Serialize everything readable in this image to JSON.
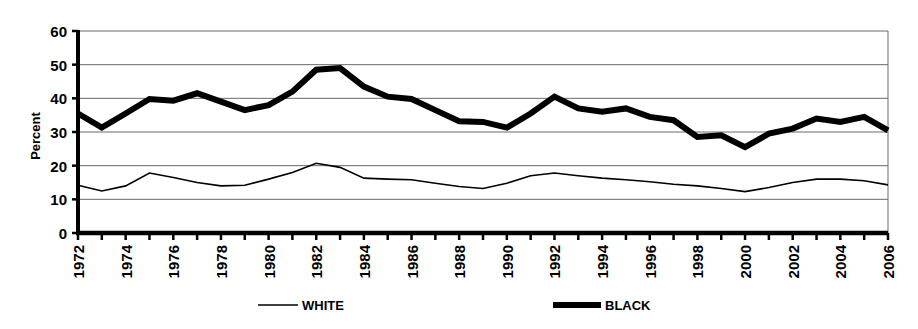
{
  "chart_data": {
    "type": "line",
    "title": "",
    "subtitle": "",
    "xlabel": "",
    "ylabel": "Percent",
    "ylim": [
      0,
      60
    ],
    "yticks": [
      0,
      10,
      20,
      30,
      40,
      50,
      60
    ],
    "ytick_labels": [
      "0",
      "10",
      "20",
      "30",
      "40",
      "50",
      "60"
    ],
    "grid": true,
    "grid_axis": "y",
    "legend_position": "bottom",
    "x": [
      1972,
      1973,
      1974,
      1975,
      1976,
      1977,
      1978,
      1979,
      1980,
      1981,
      1982,
      1983,
      1984,
      1985,
      1986,
      1987,
      1988,
      1989,
      1990,
      1991,
      1992,
      1993,
      1994,
      1995,
      1996,
      1997,
      1998,
      1999,
      2000,
      2001,
      2002,
      2003,
      2004,
      2005,
      2006
    ],
    "xtick_labels": [
      "1972",
      "",
      "1974",
      "",
      "1976",
      "",
      "1978",
      "",
      "1980",
      "",
      "1982",
      "",
      "1984",
      "",
      "1986",
      "",
      "1988",
      "",
      "1990",
      "",
      "1992",
      "",
      "1994",
      "",
      "1996",
      "",
      "1998",
      "",
      "2000",
      "",
      "2002",
      "",
      "2004",
      "",
      "2006"
    ],
    "xtick_labels_visible": [
      "1972",
      "1974",
      "1976",
      "1978",
      "1980",
      "1982",
      "1984",
      "1986",
      "1988",
      "1990",
      "1992",
      "1994",
      "1996",
      "1998",
      "2000",
      "2002",
      "2004",
      "2006"
    ],
    "xlim": [
      1972,
      2006
    ],
    "series": [
      {
        "name": "WHITE",
        "color": "#000000",
        "line_width": 1.6,
        "values": [
          14.2,
          12.5,
          14.0,
          17.8,
          16.5,
          15.0,
          14.0,
          14.2,
          16.0,
          18.0,
          20.7,
          19.5,
          16.3,
          16.0,
          15.8,
          14.8,
          13.8,
          13.2,
          14.8,
          17.0,
          17.8,
          17.0,
          16.3,
          15.8,
          15.2,
          14.5,
          14.0,
          13.2,
          12.3,
          13.5,
          15.0,
          16.0,
          16.0,
          15.5,
          14.3
        ]
      },
      {
        "name": "BLACK",
        "color": "#000000",
        "line_width": 6.0,
        "values": [
          35.5,
          31.3,
          35.5,
          39.8,
          39.3,
          41.5,
          39.0,
          36.5,
          38.0,
          42.0,
          48.5,
          49.0,
          43.5,
          40.5,
          39.8,
          36.5,
          33.2,
          33.0,
          31.3,
          35.5,
          40.5,
          37.0,
          36.0,
          37.0,
          34.5,
          33.5,
          28.5,
          29.0,
          25.5,
          29.5,
          31.0,
          34.0,
          33.0,
          34.5,
          30.5
        ]
      }
    ]
  },
  "legend": {
    "items": [
      {
        "label": "WHITE",
        "style": "thin-line"
      },
      {
        "label": "BLACK",
        "style": "thick-line"
      }
    ]
  },
  "axis": {
    "y_title": "Percent"
  }
}
